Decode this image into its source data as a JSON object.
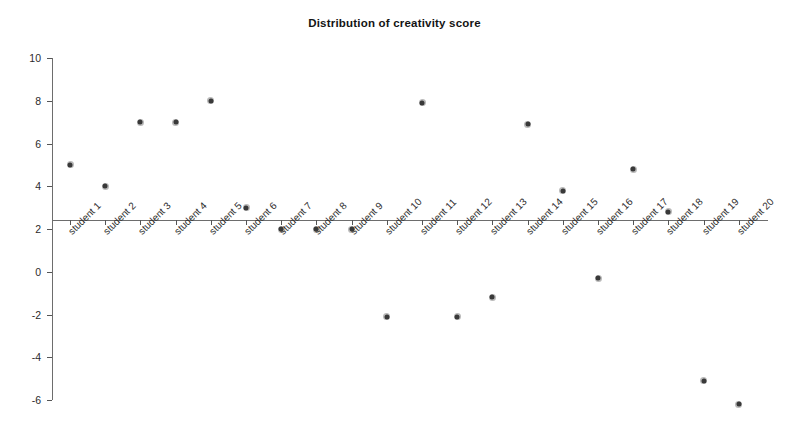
{
  "chart_data": {
    "type": "scatter",
    "title": "Distribution of creativity score",
    "xlabel": "",
    "ylabel": "",
    "grid": false,
    "legend": "none",
    "ylim": [
      -6,
      10
    ],
    "y_ticks": [
      10,
      8,
      6,
      4,
      2,
      0,
      -2,
      -4,
      -6
    ],
    "categories": [
      "student 1",
      "student 2",
      "student 3",
      "student 4",
      "student 5",
      "student 6",
      "student 7",
      "student 8",
      "student 9",
      "student 10",
      "student 11",
      "student 12",
      "student 13",
      "student 14",
      "student 15",
      "student 16",
      "student 17",
      "student 18",
      "student 19",
      "student 20"
    ],
    "values": [
      5,
      4,
      7,
      7,
      8,
      3,
      2,
      2,
      2,
      -2.1,
      7.9,
      -2.1,
      -1.2,
      6.9,
      3.8,
      -0.3,
      4.8,
      2.8,
      -5.1,
      -6.2
    ],
    "series": [
      {
        "name": "creativity score",
        "values": [
          5,
          4,
          7,
          7,
          8,
          3,
          2,
          2,
          2,
          -2.1,
          7.9,
          -2.1,
          -1.2,
          6.9,
          3.8,
          -0.3,
          4.8,
          2.8,
          -5.1,
          -6.2
        ]
      }
    ],
    "marker_color": "#3a3a3a",
    "axis_color": "#6d6d6d",
    "x_axis_crossing_value": 2.4
  }
}
